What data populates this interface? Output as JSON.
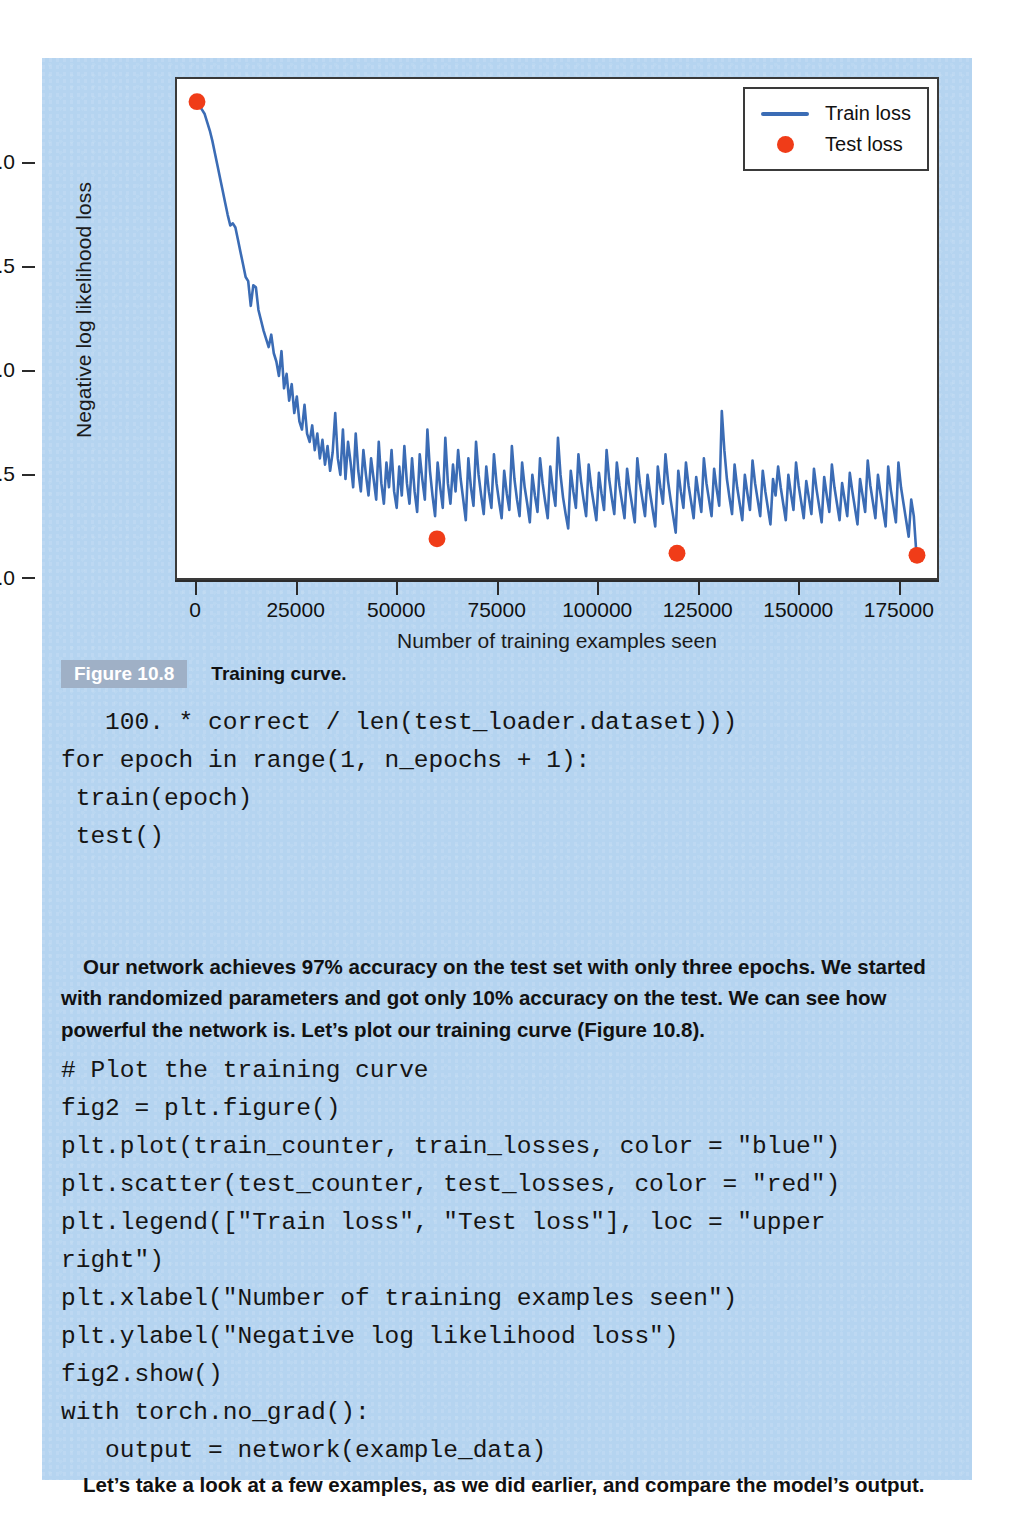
{
  "page": {
    "background_color": "#b5d4f0"
  },
  "figure": {
    "badge": "Figure 10.8",
    "caption": "Training curve."
  },
  "chart_data": {
    "type": "line",
    "title": "",
    "xlabel": "Number of training examples seen",
    "ylabel": "Negative log likelihood loss",
    "xlim": [
      -5000,
      185000
    ],
    "ylim": [
      0.0,
      2.42
    ],
    "grid": false,
    "legend_position": "upper right",
    "xticks": [
      "0",
      "25000",
      "50000",
      "75000",
      "100000",
      "125000",
      "150000",
      "175000"
    ],
    "xtick_values": [
      0,
      25000,
      50000,
      75000,
      100000,
      125000,
      150000,
      175000
    ],
    "yticks": [
      "0.0",
      "0.5",
      "1.0",
      "1.5",
      "2.0"
    ],
    "ytick_values": [
      0.0,
      0.5,
      1.0,
      1.5,
      2.0
    ],
    "series": [
      {
        "name": "Train loss",
        "type": "line",
        "color": "#3b6cb5",
        "x": [
          0,
          640,
          1280,
          1920,
          2560,
          3200,
          3840,
          4480,
          5120,
          5760,
          6400,
          7040,
          7680,
          8320,
          8960,
          9600,
          10240,
          10880,
          11520,
          12160,
          12800,
          13440,
          14080,
          14720,
          15360,
          16000,
          16640,
          17280,
          17920,
          18560,
          19200,
          19840,
          20480,
          21120,
          21760,
          22400,
          23040,
          23680,
          24320,
          24960,
          25600,
          26240,
          26880,
          27520,
          28160,
          28800,
          29440,
          30080,
          30720,
          31360,
          32000,
          32640,
          33280,
          33920,
          34560,
          35200,
          35840,
          36480,
          37120,
          37760,
          38400,
          39040,
          39680,
          40320,
          40960,
          41600,
          42240,
          42880,
          43520,
          44160,
          44800,
          45440,
          46080,
          46720,
          47360,
          48000,
          48640,
          49280,
          49920,
          50560,
          51200,
          51840,
          52480,
          53120,
          53760,
          54400,
          55040,
          55680,
          56320,
          56960,
          57600,
          58240,
          58880,
          59520,
          60160,
          60800,
          61440,
          62080,
          62720,
          63360,
          64000,
          64640,
          65280,
          65920,
          66560,
          67200,
          67840,
          68480,
          69120,
          69760,
          70400,
          71040,
          71680,
          72320,
          72960,
          73600,
          74240,
          74880,
          75520,
          76160,
          76800,
          77440,
          78080,
          78720,
          79360,
          80000,
          80640,
          81280,
          81920,
          82560,
          83200,
          83840,
          84480,
          85120,
          85760,
          86400,
          87040,
          87680,
          88320,
          88960,
          89600,
          90240,
          90880,
          91520,
          92160,
          92800,
          93440,
          94080,
          94720,
          95360,
          96000,
          96640,
          97280,
          97920,
          98560,
          99200,
          99840,
          100480,
          101120,
          101760,
          102400,
          103040,
          103680,
          104320,
          104960,
          105600,
          106240,
          106880,
          107520,
          108160,
          108800,
          109440,
          110080,
          110720,
          111360,
          112000,
          112640,
          113280,
          113920,
          114560,
          115200,
          115840,
          116480,
          117120,
          117760,
          118400,
          119040,
          119680,
          120320,
          120960,
          121600,
          122240,
          122880,
          123520,
          124160,
          124800,
          125440,
          126080,
          126720,
          127360,
          128000,
          128640,
          129280,
          129920,
          130560,
          131200,
          131840,
          132480,
          133120,
          133760,
          134400,
          135040,
          135680,
          136320,
          136960,
          137600,
          138240,
          138880,
          139520,
          140160,
          140800,
          141440,
          142080,
          142720,
          143360,
          144000,
          144640,
          145280,
          145920,
          146560,
          147200,
          147840,
          148480,
          149120,
          149760,
          150400,
          151040,
          151680,
          152320,
          152960,
          153600,
          154240,
          154880,
          155520,
          156160,
          156800,
          157440,
          158080,
          158720,
          159360,
          160000,
          160640,
          161280,
          161920,
          162560,
          163200,
          163840,
          164480,
          165120,
          165760,
          166400,
          167040,
          167680,
          168320,
          168960,
          169600,
          170240,
          170880,
          171520,
          172160,
          172800,
          173440,
          174080,
          174720,
          175360,
          176000,
          176640,
          177280,
          177920,
          178560,
          179200,
          179840
        ],
        "y": [
          2.3,
          2.29,
          2.27,
          2.25,
          2.21,
          2.17,
          2.12,
          2.06,
          2.0,
          1.94,
          1.88,
          1.82,
          1.76,
          1.71,
          1.72,
          1.7,
          1.64,
          1.58,
          1.52,
          1.46,
          1.44,
          1.32,
          1.42,
          1.41,
          1.3,
          1.25,
          1.2,
          1.16,
          1.12,
          1.18,
          1.09,
          1.05,
          0.98,
          1.1,
          0.92,
          0.99,
          0.86,
          0.94,
          0.8,
          0.88,
          0.76,
          0.72,
          0.84,
          0.7,
          0.66,
          0.74,
          0.62,
          0.7,
          0.58,
          0.67,
          0.55,
          0.64,
          0.52,
          0.61,
          0.8,
          0.58,
          0.5,
          0.72,
          0.48,
          0.66,
          0.56,
          0.44,
          0.7,
          0.52,
          0.42,
          0.62,
          0.5,
          0.4,
          0.58,
          0.48,
          0.38,
          0.66,
          0.46,
          0.36,
          0.56,
          0.44,
          0.62,
          0.42,
          0.34,
          0.54,
          0.4,
          0.64,
          0.46,
          0.36,
          0.58,
          0.42,
          0.32,
          0.6,
          0.48,
          0.38,
          0.72,
          0.52,
          0.4,
          0.3,
          0.56,
          0.44,
          0.34,
          0.68,
          0.46,
          0.36,
          0.55,
          0.42,
          0.62,
          0.48,
          0.38,
          0.28,
          0.58,
          0.44,
          0.35,
          0.66,
          0.5,
          0.4,
          0.31,
          0.54,
          0.42,
          0.34,
          0.6,
          0.46,
          0.37,
          0.29,
          0.52,
          0.41,
          0.33,
          0.64,
          0.48,
          0.38,
          0.3,
          0.56,
          0.44,
          0.36,
          0.27,
          0.5,
          0.4,
          0.32,
          0.58,
          0.46,
          0.37,
          0.29,
          0.54,
          0.43,
          0.35,
          0.68,
          0.5,
          0.39,
          0.31,
          0.24,
          0.52,
          0.42,
          0.34,
          0.6,
          0.47,
          0.38,
          0.3,
          0.55,
          0.44,
          0.36,
          0.28,
          0.51,
          0.41,
          0.33,
          0.62,
          0.48,
          0.39,
          0.31,
          0.56,
          0.45,
          0.37,
          0.29,
          0.53,
          0.43,
          0.35,
          0.27,
          0.58,
          0.46,
          0.38,
          0.3,
          0.5,
          0.41,
          0.33,
          0.25,
          0.54,
          0.44,
          0.36,
          0.6,
          0.47,
          0.38,
          0.3,
          0.22,
          0.52,
          0.42,
          0.34,
          0.56,
          0.45,
          0.37,
          0.29,
          0.49,
          0.4,
          0.32,
          0.58,
          0.46,
          0.38,
          0.3,
          0.53,
          0.43,
          0.35,
          0.81,
          0.62,
          0.48,
          0.39,
          0.31,
          0.55,
          0.44,
          0.36,
          0.28,
          0.5,
          0.41,
          0.33,
          0.57,
          0.46,
          0.38,
          0.3,
          0.52,
          0.42,
          0.34,
          0.26,
          0.48,
          0.4,
          0.54,
          0.44,
          0.36,
          0.28,
          0.5,
          0.41,
          0.33,
          0.56,
          0.45,
          0.37,
          0.29,
          0.47,
          0.39,
          0.31,
          0.53,
          0.43,
          0.35,
          0.27,
          0.49,
          0.4,
          0.32,
          0.55,
          0.44,
          0.36,
          0.28,
          0.46,
          0.38,
          0.3,
          0.51,
          0.42,
          0.34,
          0.26,
          0.48,
          0.4,
          0.32,
          0.57,
          0.45,
          0.37,
          0.29,
          0.5,
          0.41,
          0.33,
          0.25,
          0.54,
          0.43,
          0.35,
          0.27,
          0.56,
          0.44,
          0.36,
          0.28,
          0.2,
          0.38,
          0.3,
          0.12
        ]
      },
      {
        "name": "Test loss",
        "type": "scatter",
        "color": "#f03c18",
        "x": [
          0,
          60000,
          120000,
          180000
        ],
        "y": [
          2.31,
          0.19,
          0.12,
          0.11
        ]
      }
    ],
    "legend": [
      "Train loss",
      "Test loss"
    ]
  },
  "code_block_1": "   100. * correct / len(test_loader.dataset)))\nfor epoch in range(1, n_epochs + 1):\n train(epoch)\n test()",
  "paragraph_1": "Our network achieves 97% accuracy on the test set with only three epochs. We started with randomized parameters and got only 10% accuracy on the test. We can see how powerful the network is. Let’s plot our training curve (Figure 10.8).",
  "code_block_2": "# Plot the training curve\nfig2 = plt.figure()\nplt.plot(train_counter, train_losses, color = \"blue\")\nplt.scatter(test_counter, test_losses, color = \"red\")\nplt.legend([\"Train loss\", \"Test loss\"], loc = \"upper\nright\")\nplt.xlabel(\"Number of training examples seen\")\nplt.ylabel(\"Negative log likelihood loss\")\nfig2.show()\nwith torch.no_grad():\n   output = network(example_data)",
  "paragraph_2": "Let’s take a look at a few examples, as we did earlier, and compare the model’s output."
}
